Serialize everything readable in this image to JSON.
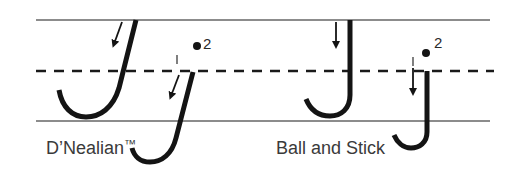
{
  "diagram": {
    "colors": {
      "guideline": "#8c8c8c",
      "midline": "#1a1a1a",
      "stroke": "#141414",
      "label_text": "#3a3a3a"
    },
    "guidelines": {
      "top": "solid",
      "middle": "dashed",
      "bottom": "solid"
    },
    "styles": [
      {
        "name": "D’Nealian",
        "trademark": "™",
        "letters": [
          {
            "char": "J",
            "case": "upper",
            "steps": []
          },
          {
            "char": "j",
            "case": "lower",
            "steps": [
              "1",
              "2"
            ]
          }
        ]
      },
      {
        "name": "Ball and Stick",
        "trademark": "",
        "letters": [
          {
            "char": "J",
            "case": "upper",
            "steps": []
          },
          {
            "char": "j",
            "case": "lower",
            "steps": [
              "1",
              "2"
            ]
          }
        ]
      }
    ]
  }
}
